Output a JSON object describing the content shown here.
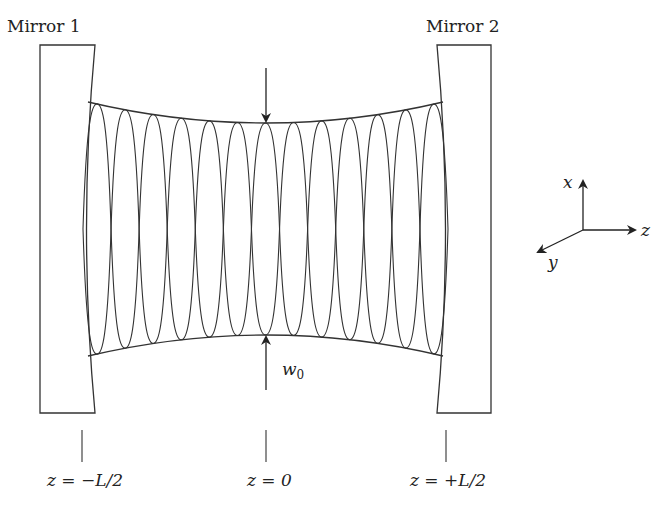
{
  "mirrors": [
    {
      "label": "Mirror 1",
      "position_label": "z = −L/2"
    },
    {
      "label": "Mirror 2",
      "position_label": "z = +L/2"
    }
  ],
  "center": {
    "position_label": "z = 0",
    "waist_label_var": "w",
    "waist_label_sub": "0"
  },
  "axes": {
    "x": "x",
    "y": "y",
    "z": "z"
  },
  "beam": {
    "crest_count": 13,
    "stroke_color": "#333333"
  }
}
